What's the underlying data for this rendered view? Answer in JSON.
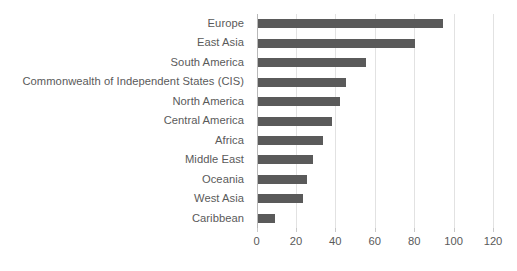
{
  "chart_data": {
    "type": "bar",
    "orientation": "horizontal",
    "title": "",
    "subtitle": "",
    "xlabel": "",
    "ylabel": "",
    "categories": [
      "Europe",
      "East Asia",
      "South America",
      "Commonwealth of Independent States (CIS)",
      "North America",
      "Central America",
      "Africa",
      "Middle East",
      "Oceania",
      "West Asia",
      "Caribbean"
    ],
    "values": [
      94,
      80,
      55,
      45,
      42,
      38,
      33,
      28,
      25,
      23,
      9
    ],
    "series": [
      {
        "name": "",
        "values": [
          94,
          80,
          55,
          45,
          42,
          38,
          33,
          28,
          25,
          23,
          9
        ]
      }
    ],
    "xlim": [
      0,
      120
    ],
    "xticks": [
      0,
      20,
      40,
      60,
      80,
      100,
      120
    ],
    "xtick_labels": [
      "0",
      "20",
      "40",
      "60",
      "80",
      "100",
      "120"
    ],
    "grid": "vertical",
    "legend": "none",
    "bar_color": "#5a5a5a",
    "gridline_color": "#e2e2e2",
    "text_color": "#5a5a5a",
    "background_color": "#ffffff"
  }
}
